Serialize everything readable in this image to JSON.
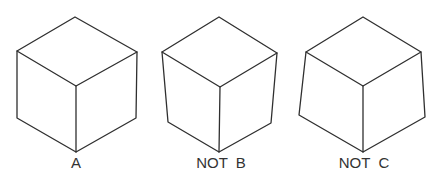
{
  "figure": {
    "width": 447,
    "height": 182,
    "stroke_color": "#2f2f2f",
    "label_color": "#333333",
    "background": "#ffffff"
  },
  "cubes": [
    {
      "id": "A",
      "label": "A",
      "label_x": 76,
      "description": "correct isometric cube with parallel vertical edges",
      "vertices": {
        "top": [
          75,
          17
        ],
        "left_top": [
          17,
          51
        ],
        "right_top": [
          137,
          52
        ],
        "center": [
          76,
          86
        ],
        "left_bottom": [
          17,
          118
        ],
        "right_bottom": [
          136,
          118
        ],
        "bottom": [
          76,
          152
        ]
      }
    },
    {
      "id": "B",
      "label": "NOT  B",
      "label_x": 221,
      "description": "cube with vertical edges converging downward (incorrect)",
      "vertices": {
        "top": [
          219,
          17
        ],
        "left_top": [
          162,
          52
        ],
        "right_top": [
          277,
          53
        ],
        "center": [
          220,
          87
        ],
        "left_bottom": [
          168,
          122
        ],
        "right_bottom": [
          271,
          123
        ],
        "bottom": [
          219,
          152
        ]
      }
    },
    {
      "id": "C",
      "label": "NOT  C",
      "label_x": 364,
      "description": "cube with vertical edges diverging downward (incorrect)",
      "vertices": {
        "top": [
          363,
          17
        ],
        "left_top": [
          306,
          52
        ],
        "right_top": [
          421,
          52
        ],
        "center": [
          363,
          86
        ],
        "left_bottom": [
          299,
          115
        ],
        "right_bottom": [
          425,
          117
        ],
        "bottom": [
          363,
          152
        ]
      }
    }
  ]
}
